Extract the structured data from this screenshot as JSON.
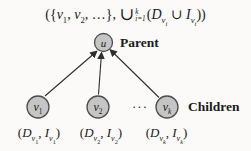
{
  "colors": {
    "background": "#fbfaf8",
    "node_fill": "#c5c5c5",
    "node_stroke": "#4d4d4d",
    "arrow": "#2e2e2e",
    "text": "#1b1b1b"
  },
  "top_formula": {
    "tokens": [
      {
        "t": "({",
        "s": "n"
      },
      {
        "t": "v",
        "s": "i"
      },
      {
        "t": "1",
        "s": "sub"
      },
      {
        "t": ", ",
        "s": "n"
      },
      {
        "t": "v",
        "s": "i"
      },
      {
        "t": "2",
        "s": "sub"
      },
      {
        "t": ", …}, ",
        "s": "n"
      },
      {
        "t": "∪",
        "s": "big"
      },
      {
        "top": "k",
        "bot": "i=1"
      },
      {
        "t": "(",
        "s": "n"
      },
      {
        "t": "D",
        "s": "i"
      },
      {
        "t": "v",
        "s": "isub"
      },
      {
        "t": "i",
        "s": "isubsub"
      },
      {
        "t": " ∪ ",
        "s": "n"
      },
      {
        "t": "I",
        "s": "i"
      },
      {
        "t": "v",
        "s": "isub"
      },
      {
        "t": "i",
        "s": "isubsub"
      },
      {
        "t": "))",
        "s": "n"
      }
    ]
  },
  "diagram": {
    "parent": {
      "role_label": "Parent",
      "node_tokens": [
        {
          "t": "u",
          "s": "i"
        }
      ]
    },
    "children": {
      "role_label": "Children",
      "dots": "···",
      "nodes": [
        {
          "node_tokens": [
            {
              "t": "v",
              "s": "i"
            },
            {
              "t": "1",
              "s": "sub"
            }
          ],
          "tuple_tokens": [
            {
              "t": "(",
              "s": "n"
            },
            {
              "t": "D",
              "s": "i"
            },
            {
              "t": "v",
              "s": "isub"
            },
            {
              "t": "1",
              "s": "subsub"
            },
            {
              "t": ", ",
              "s": "n"
            },
            {
              "t": "I",
              "s": "i"
            },
            {
              "t": "v",
              "s": "isub"
            },
            {
              "t": "1",
              "s": "subsub"
            },
            {
              "t": ")",
              "s": "n"
            }
          ]
        },
        {
          "node_tokens": [
            {
              "t": "v",
              "s": "i"
            },
            {
              "t": "2",
              "s": "sub"
            }
          ],
          "tuple_tokens": [
            {
              "t": "(",
              "s": "n"
            },
            {
              "t": "D",
              "s": "i"
            },
            {
              "t": "v",
              "s": "isub"
            },
            {
              "t": "2",
              "s": "subsub"
            },
            {
              "t": ", ",
              "s": "n"
            },
            {
              "t": "I",
              "s": "i"
            },
            {
              "t": "v",
              "s": "isub"
            },
            {
              "t": "2",
              "s": "subsub"
            },
            {
              "t": ")",
              "s": "n"
            }
          ]
        },
        {
          "node_tokens": [
            {
              "t": "v",
              "s": "i"
            },
            {
              "t": "k",
              "s": "isub"
            }
          ],
          "tuple_tokens": [
            {
              "t": "(",
              "s": "n"
            },
            {
              "t": "D",
              "s": "i"
            },
            {
              "t": "v",
              "s": "isub"
            },
            {
              "t": "k",
              "s": "isubsub"
            },
            {
              "t": ", ",
              "s": "n"
            },
            {
              "t": "I",
              "s": "i"
            },
            {
              "t": "v",
              "s": "isub"
            },
            {
              "t": "k",
              "s": "isubsub"
            },
            {
              "t": ")",
              "s": "n"
            }
          ]
        }
      ]
    }
  }
}
